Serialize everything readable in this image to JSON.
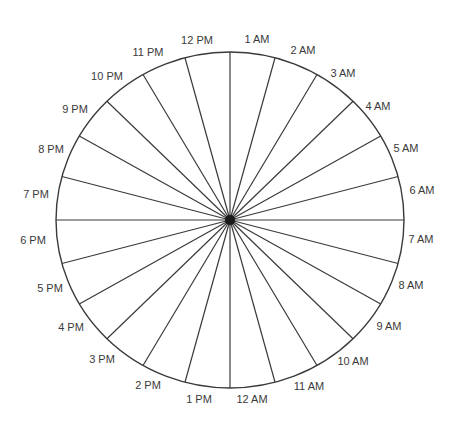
{
  "diagram": {
    "type": "24-hour clock wheel",
    "center": {
      "x": 230,
      "y": 220
    },
    "radius": {
      "rx": 174,
      "ry": 168
    },
    "stroke_color": "#3a3a3a",
    "hub_color": "#1a1a1a",
    "spoke_count": 24,
    "labels": [
      {
        "text": "1 AM",
        "x": 257,
        "y": 40
      },
      {
        "text": "2 AM",
        "x": 303,
        "y": 51
      },
      {
        "text": "3 AM",
        "x": 343,
        "y": 74
      },
      {
        "text": "4 AM",
        "x": 378,
        "y": 107
      },
      {
        "text": "5 AM",
        "x": 406,
        "y": 149
      },
      {
        "text": "6 AM",
        "x": 422,
        "y": 191
      },
      {
        "text": "7 AM",
        "x": 421,
        "y": 240
      },
      {
        "text": "8 AM",
        "x": 411,
        "y": 286
      },
      {
        "text": "9 AM",
        "x": 389,
        "y": 327
      },
      {
        "text": "10 AM",
        "x": 353,
        "y": 362
      },
      {
        "text": "11 AM",
        "x": 309,
        "y": 387
      },
      {
        "text": "12 AM",
        "x": 252,
        "y": 400
      },
      {
        "text": "1 PM",
        "x": 199,
        "y": 400
      },
      {
        "text": "2 PM",
        "x": 148,
        "y": 386
      },
      {
        "text": "3 PM",
        "x": 102,
        "y": 360
      },
      {
        "text": "4 PM",
        "x": 71,
        "y": 328
      },
      {
        "text": "5 PM",
        "x": 50,
        "y": 289
      },
      {
        "text": "6 PM",
        "x": 33,
        "y": 241
      },
      {
        "text": "7 PM",
        "x": 36,
        "y": 195
      },
      {
        "text": "8 PM",
        "x": 51,
        "y": 150
      },
      {
        "text": "9 PM",
        "x": 75,
        "y": 110
      },
      {
        "text": "10 PM",
        "x": 107,
        "y": 77
      },
      {
        "text": "11 PM",
        "x": 148,
        "y": 53
      },
      {
        "text": "12 PM",
        "x": 197,
        "y": 41
      }
    ]
  }
}
